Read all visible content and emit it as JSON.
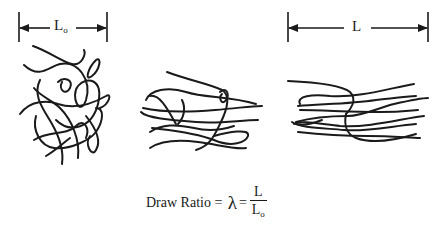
{
  "diagram": {
    "initial_length": {
      "label": "L",
      "subscript": "o"
    },
    "final_length": {
      "label": "L"
    },
    "states": [
      "Undrawn (random coil)",
      "Partially drawn",
      "Drawn (oriented)"
    ],
    "formula": {
      "lhs": "Draw Ratio",
      "equals1": " = ",
      "symbol": "λ",
      "equals2": "=",
      "numerator": "L",
      "denominator": "L",
      "denominator_subscript": "o"
    },
    "colors": {
      "ink": "#1a1a1a",
      "background": "#ffffff"
    }
  }
}
